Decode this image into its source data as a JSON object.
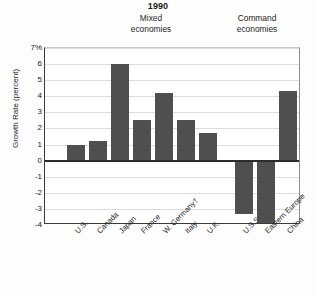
{
  "chart_data": {
    "type": "bar",
    "title": "1990",
    "xlabel": "",
    "ylabel": "Growth Rate (percent)",
    "ylim": [
      -4,
      7
    ],
    "yticks": [
      "7%",
      "6",
      "5",
      "4",
      "3",
      "2",
      "1",
      "0",
      "-1",
      "-2",
      "-3",
      "-4"
    ],
    "ytick_values": [
      7,
      6,
      5,
      4,
      3,
      2,
      1,
      0,
      -1,
      -2,
      -3,
      -4
    ],
    "grid": true,
    "legend": "none",
    "bar_color": "#4f4f4f",
    "groups": [
      {
        "name": "Mixed economies",
        "label_line1": "Mixed",
        "label_line2": "economies"
      },
      {
        "name": "Command economies",
        "label_line1": "Command",
        "label_line2": "economies"
      }
    ],
    "categories": [
      "U.S.",
      "Canada",
      "Japan",
      "France",
      "W. Germany†",
      "Italy",
      "U.K.",
      "U.S.S.R.*",
      "Eastern Europe",
      "China"
    ],
    "values": [
      1.0,
      1.2,
      6.0,
      2.5,
      4.2,
      2.5,
      1.7,
      -3.3,
      -4.0,
      4.3
    ],
    "bars": [
      {
        "label": "U.S.",
        "value": 1.0,
        "group": "Mixed economies"
      },
      {
        "label": "Canada",
        "value": 1.2,
        "group": "Mixed economies"
      },
      {
        "label": "Japan",
        "value": 6.0,
        "group": "Mixed economies"
      },
      {
        "label": "France",
        "value": 2.5,
        "group": "Mixed economies"
      },
      {
        "label": "W. Germany†",
        "value": 4.2,
        "group": "Mixed economies"
      },
      {
        "label": "Italy",
        "value": 2.5,
        "group": "Mixed economies"
      },
      {
        "label": "U.K.",
        "value": 1.7,
        "group": "Mixed economies"
      },
      {
        "label": "U.S.S.R.*",
        "value": -3.3,
        "group": "Command economies"
      },
      {
        "label": "Eastern Europe",
        "value": -4.0,
        "group": "Command economies"
      },
      {
        "label": "China",
        "value": 4.3,
        "group": "Command economies"
      }
    ]
  },
  "title": "1990",
  "ylabel": "Growth Rate (percent)",
  "groups": {
    "mixed_line1": "Mixed",
    "mixed_line2": "economies",
    "command_line1": "Command",
    "command_line2": "economies"
  }
}
